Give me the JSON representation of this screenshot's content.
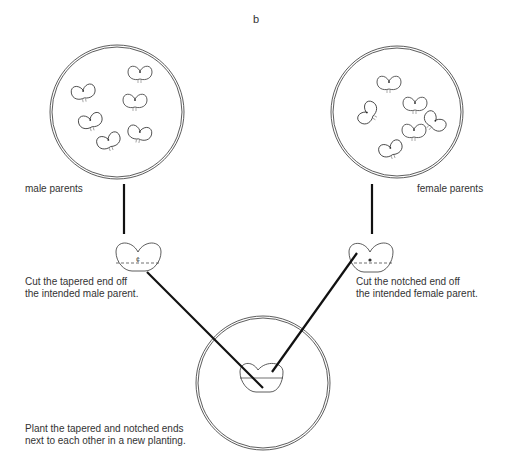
{
  "figure": {
    "panel_letter": "b",
    "groups": {
      "male": {
        "label": "male parents",
        "bulb_count": 6,
        "instruction": [
          "Cut the tapered end off",
          "the intended male parent."
        ]
      },
      "female": {
        "label": "female parents",
        "bulb_count": 7,
        "instruction": [
          "Cut the notched end off",
          "the intended female parent."
        ]
      },
      "new_planting": {
        "instruction": [
          "Plant the tapered and notched ends",
          "next to each other in a new planting."
        ]
      }
    },
    "colors": {
      "line": "#111111",
      "outline": "#333333",
      "background": "#ffffff"
    }
  }
}
